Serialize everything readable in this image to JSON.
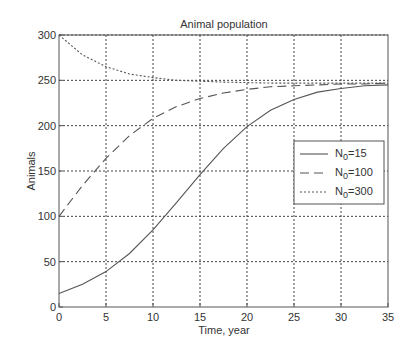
{
  "chart_data": {
    "type": "line",
    "title": "Animal population",
    "xlabel": "Time, year",
    "ylabel": "Animals",
    "xlim": [
      0,
      35
    ],
    "ylim": [
      0,
      300
    ],
    "xticks": [
      0,
      5,
      10,
      15,
      20,
      25,
      30,
      35
    ],
    "yticks": [
      0,
      50,
      100,
      150,
      200,
      250,
      300
    ],
    "xtick_labels": [
      "0",
      "5",
      "10",
      "15",
      "20",
      "25",
      "30",
      "35"
    ],
    "ytick_labels": [
      "0",
      "50",
      "100",
      "150",
      "200",
      "250",
      "300"
    ],
    "grid": true,
    "legend_position": "center-right",
    "x": [
      0,
      2.5,
      5,
      7.5,
      10,
      12.5,
      15,
      17.5,
      20,
      22.5,
      25,
      27.5,
      30,
      32.5,
      35
    ],
    "series": [
      {
        "name": "N0=15",
        "legend_main": "N",
        "legend_sub": "0",
        "legend_rest": "=15",
        "style": "solid",
        "values": [
          15,
          25,
          39,
          59,
          85,
          115,
          146,
          175,
          199,
          217,
          229,
          237,
          241,
          244,
          245
        ]
      },
      {
        "name": "N0=100",
        "legend_main": "N",
        "legend_sub": "0",
        "legend_rest": "=100",
        "style": "dashed",
        "values": [
          100,
          134,
          164,
          189,
          208,
          221,
          230,
          236,
          240,
          243,
          244,
          245,
          246,
          246,
          247
        ]
      },
      {
        "name": "N0=300",
        "legend_main": "N",
        "legend_sub": "0",
        "legend_rest": "=300",
        "style": "dotted",
        "values": [
          300,
          278,
          265,
          257,
          253,
          250,
          249,
          248,
          247.5,
          247,
          247,
          247,
          247,
          247,
          247
        ]
      }
    ]
  }
}
